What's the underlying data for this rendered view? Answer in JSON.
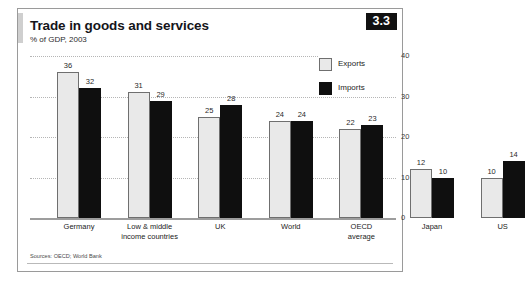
{
  "figure": {
    "title": "Trade in goods and services",
    "subtitle": "% of GDP, 2003",
    "badge": "3.3",
    "source": "Sources: OECD; World Bank"
  },
  "legend": {
    "items": [
      {
        "label": "Exports",
        "swatch": "light-gray",
        "color": "#e9e9e9"
      },
      {
        "label": "Imports",
        "swatch": "black",
        "color": "#0f0f0f"
      }
    ]
  },
  "chart_data": {
    "type": "bar",
    "title": "Trade in goods and services",
    "subtitle": "% of GDP, 2003",
    "xlabel": "",
    "ylabel": "",
    "ylim": [
      0,
      40
    ],
    "yticks": [
      0,
      10,
      20,
      30,
      40
    ],
    "ytick_labels": [
      "0",
      "10",
      "20",
      "30",
      "40"
    ],
    "grid": "horizontal-dotted",
    "legend_position": "top-right",
    "categories": [
      "Germany",
      "Low & middle income countries",
      "UK",
      "World",
      "OECD average",
      "Japan",
      "US"
    ],
    "category_lines": [
      [
        "Germany"
      ],
      [
        "Low & middle",
        "income countries"
      ],
      [
        "UK"
      ],
      [
        "World"
      ],
      [
        "OECD",
        "average"
      ],
      [
        "Japan"
      ],
      [
        "US"
      ]
    ],
    "series": [
      {
        "name": "Exports",
        "color": "#e9e9e9",
        "values": [
          36,
          31,
          25,
          24,
          22,
          12,
          10
        ]
      },
      {
        "name": "Imports",
        "color": "#0f0f0f",
        "values": [
          32,
          29,
          28,
          24,
          23,
          10,
          14
        ]
      }
    ],
    "source": "Sources: OECD; World Bank"
  }
}
